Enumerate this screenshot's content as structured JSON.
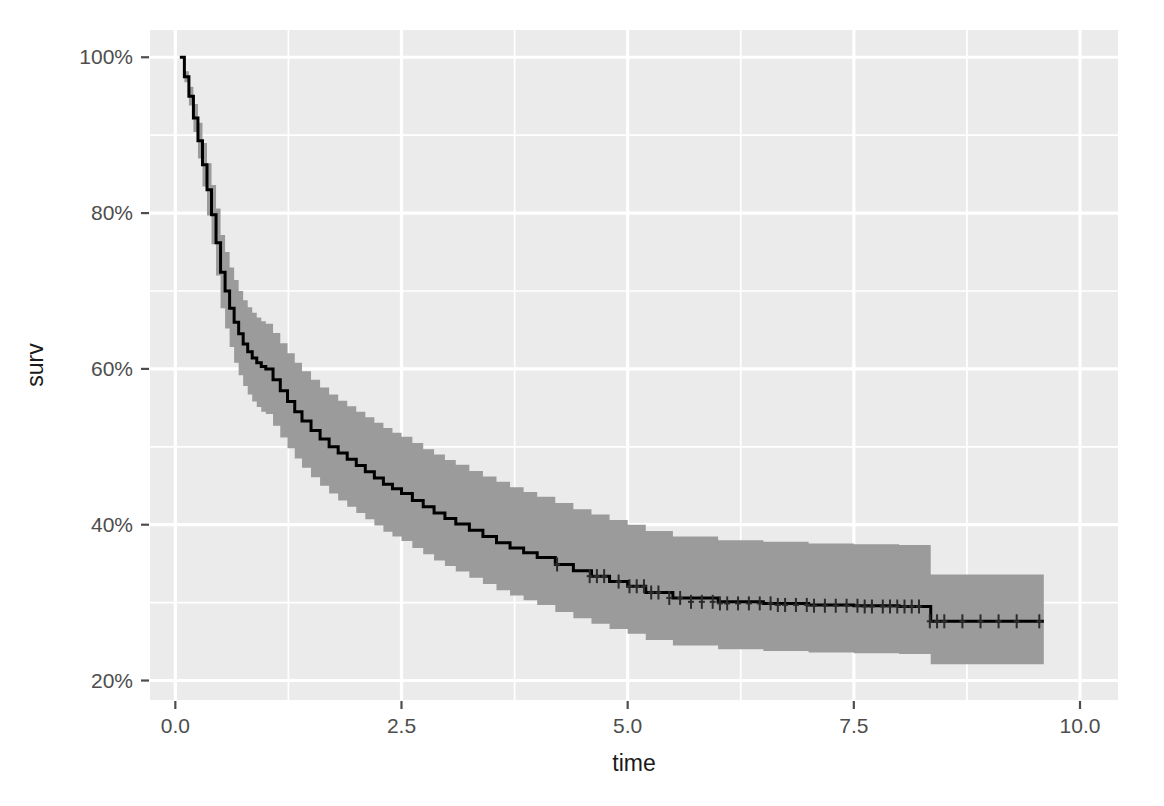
{
  "chart_data": {
    "type": "line",
    "title": "",
    "subtitle": "",
    "xlabel": "time",
    "ylabel": "surv",
    "xlim": [
      -0.28,
      10.42
    ],
    "ylim": [
      0.175,
      1.035
    ],
    "grid": true,
    "legend": null,
    "plot_style": "ggplot2-theme-grey",
    "x_ticks": [
      0.0,
      2.5,
      5.0,
      7.5,
      10.0
    ],
    "x_tick_labels": [
      "0.0",
      "2.5",
      "5.0",
      "7.5",
      "10.0"
    ],
    "y_ticks": [
      0.2,
      0.4,
      0.6,
      0.8,
      1.0
    ],
    "y_tick_labels": [
      "20%",
      "40%",
      "60%",
      "80%",
      "100%"
    ],
    "x_minor_ticks": [
      1.25,
      3.75,
      6.25,
      8.75
    ],
    "y_minor_ticks": [
      0.3,
      0.5,
      0.7,
      0.9
    ],
    "colors": {
      "panel_background": "#EBEBEB",
      "gridline": "#FFFFFF",
      "confidence_band": "#9B9B9B",
      "survival_line": "#000000",
      "censor_mark": "#2B2B2B",
      "axis_text": "#4D4D4D",
      "axis_title": "#1A1A1A",
      "figure_background": "#FFFFFF"
    },
    "series": [
      {
        "name": "surv",
        "kind": "kaplan-meier-step",
        "x": [
          0.05,
          0.1,
          0.15,
          0.2,
          0.25,
          0.3,
          0.35,
          0.4,
          0.45,
          0.5,
          0.55,
          0.6,
          0.65,
          0.7,
          0.75,
          0.8,
          0.85,
          0.9,
          0.95,
          1.0,
          1.08,
          1.16,
          1.24,
          1.32,
          1.4,
          1.5,
          1.6,
          1.7,
          1.8,
          1.9,
          2.0,
          2.1,
          2.2,
          2.3,
          2.4,
          2.5,
          2.62,
          2.74,
          2.86,
          2.98,
          3.1,
          3.25,
          3.4,
          3.55,
          3.7,
          3.85,
          4.0,
          4.2,
          4.4,
          4.6,
          4.8,
          5.0,
          5.2,
          5.5,
          6.0,
          6.5,
          7.0,
          7.5,
          8.0,
          8.28,
          8.35,
          9.0,
          9.6
        ],
        "y": [
          1.0,
          0.975,
          0.95,
          0.922,
          0.893,
          0.862,
          0.83,
          0.798,
          0.762,
          0.724,
          0.7,
          0.678,
          0.66,
          0.645,
          0.632,
          0.622,
          0.614,
          0.608,
          0.603,
          0.6,
          0.586,
          0.572,
          0.558,
          0.545,
          0.533,
          0.521,
          0.51,
          0.5,
          0.492,
          0.484,
          0.476,
          0.468,
          0.46,
          0.452,
          0.446,
          0.44,
          0.431,
          0.423,
          0.415,
          0.408,
          0.401,
          0.393,
          0.385,
          0.377,
          0.37,
          0.364,
          0.358,
          0.349,
          0.341,
          0.334,
          0.327,
          0.321,
          0.313,
          0.306,
          0.301,
          0.299,
          0.297,
          0.296,
          0.295,
          0.295,
          0.276,
          0.276,
          0.276
        ]
      }
    ],
    "confidence_band": {
      "level": "0.95",
      "x": [
        0.05,
        0.1,
        0.15,
        0.2,
        0.25,
        0.3,
        0.35,
        0.4,
        0.45,
        0.5,
        0.55,
        0.6,
        0.65,
        0.7,
        0.75,
        0.8,
        0.85,
        0.9,
        0.95,
        1.0,
        1.08,
        1.16,
        1.24,
        1.32,
        1.4,
        1.5,
        1.6,
        1.7,
        1.8,
        1.9,
        2.0,
        2.1,
        2.2,
        2.3,
        2.4,
        2.5,
        2.62,
        2.74,
        2.86,
        2.98,
        3.1,
        3.25,
        3.4,
        3.55,
        3.7,
        3.85,
        4.0,
        4.2,
        4.4,
        4.6,
        4.8,
        5.0,
        5.2,
        5.5,
        6.0,
        6.5,
        7.0,
        7.5,
        8.0,
        8.28,
        8.35,
        9.0,
        9.6
      ],
      "upper": [
        1.0,
        0.982,
        0.962,
        0.94,
        0.916,
        0.89,
        0.864,
        0.836,
        0.806,
        0.772,
        0.75,
        0.73,
        0.714,
        0.7,
        0.688,
        0.679,
        0.672,
        0.666,
        0.661,
        0.658,
        0.646,
        0.633,
        0.62,
        0.608,
        0.597,
        0.586,
        0.576,
        0.567,
        0.559,
        0.552,
        0.545,
        0.538,
        0.531,
        0.524,
        0.518,
        0.513,
        0.505,
        0.497,
        0.49,
        0.483,
        0.477,
        0.469,
        0.462,
        0.455,
        0.448,
        0.442,
        0.436,
        0.428,
        0.42,
        0.413,
        0.406,
        0.4,
        0.392,
        0.385,
        0.38,
        0.378,
        0.376,
        0.375,
        0.374,
        0.374,
        0.336,
        0.336,
        0.336
      ],
      "lower": [
        1.0,
        0.968,
        0.938,
        0.904,
        0.87,
        0.834,
        0.797,
        0.76,
        0.72,
        0.678,
        0.652,
        0.628,
        0.608,
        0.592,
        0.578,
        0.567,
        0.558,
        0.551,
        0.545,
        0.542,
        0.527,
        0.512,
        0.498,
        0.485,
        0.473,
        0.461,
        0.45,
        0.44,
        0.431,
        0.423,
        0.415,
        0.407,
        0.399,
        0.391,
        0.385,
        0.379,
        0.37,
        0.362,
        0.354,
        0.347,
        0.34,
        0.332,
        0.324,
        0.316,
        0.309,
        0.303,
        0.297,
        0.288,
        0.28,
        0.273,
        0.266,
        0.26,
        0.252,
        0.245,
        0.24,
        0.238,
        0.236,
        0.235,
        0.234,
        0.234,
        0.221,
        0.221,
        0.221
      ]
    },
    "censor_marks": {
      "symbol": "+",
      "x": [
        4.22,
        4.58,
        4.66,
        4.74,
        4.9,
        5.02,
        5.1,
        5.18,
        5.26,
        5.34,
        5.46,
        5.58,
        5.7,
        5.82,
        5.94,
        6.02,
        6.1,
        6.22,
        6.34,
        6.46,
        6.58,
        6.66,
        6.74,
        6.86,
        6.98,
        7.06,
        7.18,
        7.3,
        7.42,
        7.54,
        7.62,
        7.7,
        7.82,
        7.9,
        7.98,
        8.06,
        8.14,
        8.22,
        8.34,
        8.42,
        8.5,
        8.7,
        8.9,
        9.1,
        9.3,
        9.55
      ],
      "y": [
        0.349,
        0.334,
        0.334,
        0.334,
        0.327,
        0.321,
        0.321,
        0.321,
        0.313,
        0.313,
        0.306,
        0.306,
        0.301,
        0.301,
        0.301,
        0.299,
        0.299,
        0.299,
        0.299,
        0.299,
        0.299,
        0.297,
        0.297,
        0.297,
        0.297,
        0.296,
        0.296,
        0.296,
        0.296,
        0.296,
        0.295,
        0.295,
        0.295,
        0.295,
        0.295,
        0.295,
        0.295,
        0.295,
        0.276,
        0.276,
        0.276,
        0.276,
        0.276,
        0.276,
        0.276,
        0.276
      ]
    }
  },
  "axes": {
    "y_label": "surv",
    "x_label": "time",
    "y_tick_labels": [
      "100%",
      "80%",
      "60%",
      "40%",
      "20%"
    ],
    "x_tick_labels": [
      "0.0",
      "2.5",
      "5.0",
      "7.5",
      "10.0"
    ]
  }
}
